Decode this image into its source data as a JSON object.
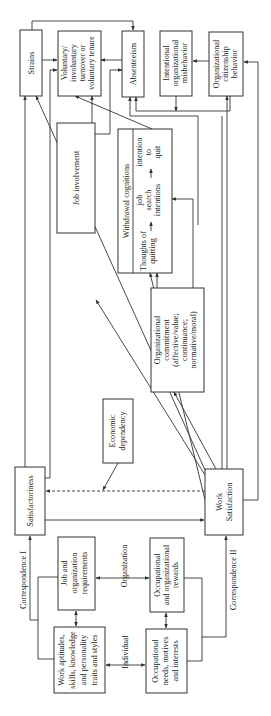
{
  "diagram": {
    "orientation": "rotated -90deg (text reads bottom-to-top)",
    "boxes": {
      "strains": [
        "Strains"
      ],
      "turnover": [
        "Voluntary/",
        "involuntary",
        "turnover or",
        "voluntary tenure"
      ],
      "absenteeism": [
        "Absenteeism"
      ],
      "misbehavior": [
        "Intentional",
        "organizational",
        "misbehavior"
      ],
      "ocb": [
        "Organizational",
        "citizenship",
        "behavior"
      ],
      "withdrawal_title": [
        "Withdrawal cognitions"
      ],
      "withdrawal_thoughts": [
        "Thoughts of",
        "quitting"
      ],
      "withdrawal_search": [
        "job",
        "search",
        "intentions"
      ],
      "withdrawal_intention": [
        "intention",
        "to",
        "quit"
      ],
      "job_involvement": [
        "Job involvement"
      ],
      "org_commitment": [
        "Organizational",
        "commitment",
        "(affective/value;",
        "continuance;",
        "normative/moral)"
      ],
      "economic_dependency": [
        "Economic",
        "dependency"
      ],
      "satisfactoriness": [
        "Satisfactoriness"
      ],
      "work_satisfaction": [
        "Work",
        "Satisfaction"
      ],
      "job_org_requirements": [
        "Job and",
        "organization",
        "requirements"
      ],
      "work_aptitudes": [
        "Work aptitudes,",
        "skills, knowledge",
        "and personality",
        "traits and styles"
      ],
      "occupational_rewards": [
        "Occupational",
        "and organizational",
        "rewards"
      ],
      "occupational_needs": [
        "Occupational",
        "needs, motives",
        "and interests"
      ]
    },
    "labels": {
      "organization": "Organization",
      "individual": "Individual",
      "correspondence_1": "Correspondence I",
      "correspondence_2": "Correspondence II"
    }
  }
}
